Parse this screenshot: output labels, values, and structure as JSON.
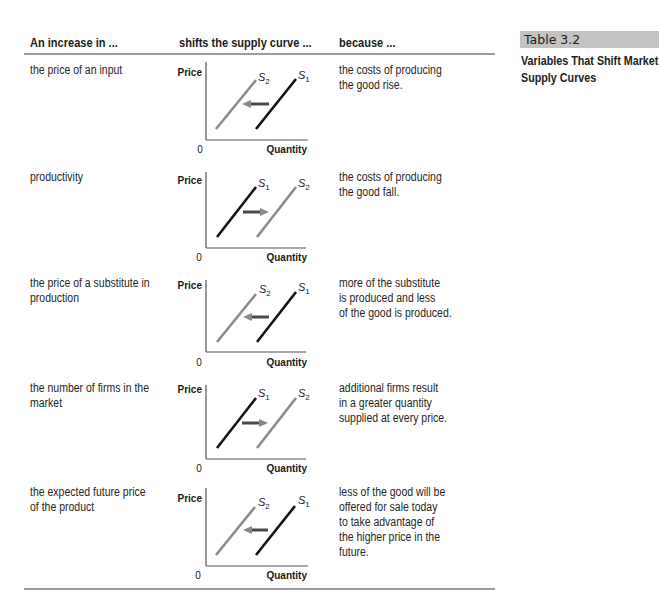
{
  "sidebar_caption": {
    "table_number": "Table 3.2",
    "title_lines": [
      "Variables That Shift Market",
      "Supply Curves"
    ]
  },
  "table": {
    "headers": [
      "An increase in ...",
      "shifts the supply curve ...",
      "because ..."
    ],
    "graph_axis": {
      "y_label": "Price",
      "x_label": "Quantity",
      "origin": "0"
    },
    "rows": [
      {
        "variable_lines": [
          "the price of an input"
        ],
        "shift_direction": "left",
        "left_curve": {
          "letter": "S",
          "sub": "2"
        },
        "right_curve": {
          "letter": "S",
          "sub": "1"
        },
        "reason_lines": [
          "the costs of producing",
          "the good rise."
        ]
      },
      {
        "variable_lines": [
          "productivity"
        ],
        "shift_direction": "right",
        "left_curve": {
          "letter": "S",
          "sub": "1"
        },
        "right_curve": {
          "letter": "S",
          "sub": "2"
        },
        "reason_lines": [
          "the costs of producing",
          "the good fall."
        ]
      },
      {
        "variable_lines": [
          "the price of a substitute in",
          "production"
        ],
        "shift_direction": "left",
        "left_curve": {
          "letter": "S",
          "sub": "2"
        },
        "right_curve": {
          "letter": "S",
          "sub": "1"
        },
        "reason_lines": [
          "more of the substitute",
          "is produced and less",
          "of the good is produced."
        ]
      },
      {
        "variable_lines": [
          "the number of firms in the",
          "market"
        ],
        "shift_direction": "right",
        "left_curve": {
          "letter": "S",
          "sub": "1"
        },
        "right_curve": {
          "letter": "S",
          "sub": "2"
        },
        "reason_lines": [
          "additional firms result",
          "in a greater quantity",
          "supplied at every price."
        ]
      },
      {
        "variable_lines": [
          "the expected future price",
          "of the product"
        ],
        "shift_direction": "left",
        "left_curve": {
          "letter": "S",
          "sub": "2"
        },
        "right_curve": {
          "letter": "S",
          "sub": "1"
        },
        "reason_lines": [
          "less of the good will be",
          "offered for sale today",
          "to take advantage of",
          "the higher price in the",
          "future."
        ]
      }
    ]
  },
  "colors": {
    "original_curve": "#111111",
    "new_curve": "#8c8c8c",
    "arrow_shaft": "#4a4a4a",
    "arrow_head": "#8a8a8a",
    "rule": "#9c9c9c",
    "caption_box": "#c3c3c3"
  }
}
